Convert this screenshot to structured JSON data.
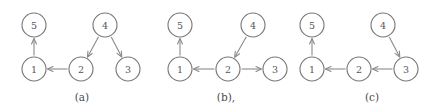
{
  "figure": {
    "width": 442,
    "height": 109,
    "background": "#ffffff",
    "node_stroke": "#777777",
    "node_fill": "#ffffff",
    "edge_color": "#8a8a8e",
    "label_color": "#55555a",
    "caption_color": "#4a4a4f",
    "node_radius": 12
  },
  "panels": [
    {
      "id": "panel-a",
      "caption": "(a)",
      "caption_x": 82,
      "caption_y": 101,
      "nodes": [
        {
          "label": "5",
          "x": 34,
          "y": 25
        },
        {
          "label": "4",
          "x": 105,
          "y": 25
        },
        {
          "label": "1",
          "x": 34,
          "y": 69
        },
        {
          "label": "2",
          "x": 81,
          "y": 69
        },
        {
          "label": "3",
          "x": 128,
          "y": 69
        }
      ],
      "edges": [
        {
          "from": "1",
          "to": "5"
        },
        {
          "from": "4",
          "to": "2"
        },
        {
          "from": "4",
          "to": "3"
        },
        {
          "from": "2",
          "to": "1"
        }
      ]
    },
    {
      "id": "panel-b",
      "caption": "(b),",
      "caption_x": 226,
      "caption_y": 101,
      "nodes": [
        {
          "label": "5",
          "x": 180,
          "y": 25
        },
        {
          "label": "4",
          "x": 253,
          "y": 25
        },
        {
          "label": "1",
          "x": 180,
          "y": 69
        },
        {
          "label": "2",
          "x": 228,
          "y": 69
        },
        {
          "label": "3",
          "x": 275,
          "y": 69
        }
      ],
      "edges": [
        {
          "from": "1",
          "to": "5"
        },
        {
          "from": "4",
          "to": "2"
        },
        {
          "from": "2",
          "to": "1"
        },
        {
          "from": "2",
          "to": "3"
        }
      ]
    },
    {
      "id": "panel-c",
      "caption": "(c)",
      "caption_x": 372,
      "caption_y": 101,
      "nodes": [
        {
          "label": "5",
          "x": 312,
          "y": 25
        },
        {
          "label": "4",
          "x": 383,
          "y": 25
        },
        {
          "label": "1",
          "x": 312,
          "y": 69
        },
        {
          "label": "2",
          "x": 359,
          "y": 69
        },
        {
          "label": "3",
          "x": 406,
          "y": 69
        }
      ],
      "edges": [
        {
          "from": "1",
          "to": "5"
        },
        {
          "from": "4",
          "to": "3"
        },
        {
          "from": "3",
          "to": "2"
        },
        {
          "from": "2",
          "to": "1"
        }
      ]
    }
  ]
}
